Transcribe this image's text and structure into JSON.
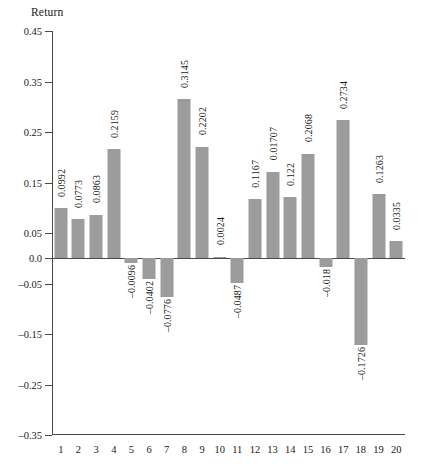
{
  "chart_data": {
    "type": "bar",
    "title": "",
    "ylabel": "Return",
    "xlabel": "",
    "ylim": [
      -0.35,
      0.45
    ],
    "yticks": [
      0.45,
      0.35,
      0.25,
      0.15,
      0.05,
      0.0,
      -0.05,
      -0.15,
      -0.25,
      -0.35
    ],
    "ytick_labels": [
      "0.45",
      "0.35",
      "0.25",
      "0.15",
      "0.05",
      "0.0",
      "-0.05",
      "-0.15",
      "-0.25",
      "-0.35"
    ],
    "grid": false,
    "legend": false,
    "zero_line": true,
    "bar_color": "#9c9c9c",
    "axis_color": "#4a4a4a",
    "categories": [
      "1",
      "2",
      "3",
      "4",
      "5",
      "6",
      "7",
      "8",
      "9",
      "10",
      "11",
      "12",
      "13",
      "14",
      "15",
      "16",
      "17",
      "18",
      "19",
      "20"
    ],
    "values": [
      0.0992,
      0.0773,
      0.0863,
      0.2159,
      -0.0096,
      -0.0402,
      -0.0776,
      0.3145,
      0.2202,
      0.0024,
      -0.0487,
      0.1167,
      0.1707,
      0.122,
      0.2068,
      -0.018,
      0.2734,
      -0.1726,
      0.1263,
      0.0335
    ],
    "data_labels": [
      "0.0992",
      "0.0773",
      "0.0863",
      "0.2159",
      "-0.0096",
      "-0.0402",
      "-0.0776",
      "0.3145",
      "0.2202",
      "0.0024",
      "-0.0487",
      "0.1167",
      "0.01707",
      "0.122",
      "0.2068",
      "-0.018",
      "0.2734",
      "-0.1726",
      "0.1263",
      "0.0335"
    ]
  }
}
